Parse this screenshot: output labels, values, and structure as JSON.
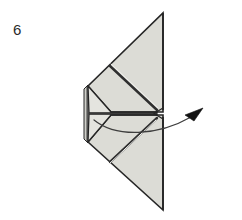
{
  "page": {
    "background_color": "#ffffff",
    "width": 242,
    "height": 220
  },
  "step": {
    "number_label": "6",
    "number_color": "#2b2b2b"
  },
  "palette": {
    "paper_fill": "#dcdcd6",
    "paper_fill_light": "#e6e6e1",
    "paper_fill_shadow": "#cfcfc9",
    "outline": "#262626",
    "fold_line": "#3a3a3a",
    "arrow_line": "#3d3d3d",
    "arrow_head": "#111111",
    "edge_highlight": "#f2f2ef"
  },
  "figure": {
    "name": "folded-paper-fan",
    "shapes": [
      {
        "name": "upper-triangle-flap",
        "fill": "paper_fill",
        "points": "163,13 163,111 112,111 88,86"
      },
      {
        "name": "lower-triangle-flap",
        "fill": "paper_fill",
        "points": "163,210 163,116 112,116 88,142"
      },
      {
        "name": "centre-panel-upper",
        "fill": "paper_fill_light",
        "points": "88,86 112,111 158,111 158,113 90,113"
      },
      {
        "name": "centre-panel-lower",
        "fill": "paper_fill_light",
        "points": "88,142 112,116 158,116 158,114 90,114"
      },
      {
        "name": "left-layer-spine",
        "fill": "paper_fill_shadow",
        "points": "85,88 88,86 88,142 85,140"
      }
    ],
    "fold_lines": [
      {
        "name": "upper-diagonal-crease",
        "from": [
          110,
          66
        ],
        "to": [
          158,
          110
        ]
      },
      {
        "name": "lower-diagonal-crease",
        "from": [
          110,
          162
        ],
        "to": [
          158,
          118
        ]
      },
      {
        "name": "centre-horizontal-crease",
        "from": [
          89,
          114
        ],
        "to": [
          157,
          114
        ]
      },
      {
        "name": "upper-inner-crease",
        "from": [
          88,
          86
        ],
        "to": [
          112,
          111
        ]
      },
      {
        "name": "lower-inner-crease",
        "from": [
          88,
          142
        ],
        "to": [
          112,
          116
        ]
      }
    ],
    "notch": {
      "name": "centre-right-notch",
      "points": "158,108 152,114 158,120"
    },
    "arrow": {
      "name": "unfold-arrow",
      "path": "M 95,120 C 118,137 160,134 193,116",
      "stroke_width": 1.2,
      "head_points": "202,110 186,116 194,121",
      "direction": "right-and-up"
    }
  }
}
